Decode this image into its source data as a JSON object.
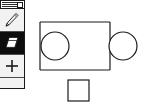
{
  "app": {
    "title": "",
    "background_color": "#ffffff",
    "ink_color": "#1a1a1a",
    "width": 155,
    "height": 110
  },
  "tool_palette": {
    "name": "Tools",
    "x": 0,
    "y": 0,
    "width": 25,
    "height": 89,
    "background_color": "#f2f2f2",
    "border_color": "#1a1a1a",
    "titlebar": {
      "stripe_color": "#2b2b2b",
      "close_box_label": "",
      "close_box_name": "close-box"
    },
    "tools": [
      {
        "id": "pencil",
        "label": "Pencil",
        "icon": "pencil-icon",
        "selected": false,
        "background_color": "#f2f2f2",
        "glyph_color": "#1a1a1a"
      },
      {
        "id": "eraser",
        "label": "Eraser",
        "icon": "eraser-icon",
        "selected": true,
        "background_color": "#0d0d0d",
        "glyph_color": "#ffffff"
      },
      {
        "id": "plus",
        "label": "Crosshair",
        "icon": "plus-icon",
        "selected": false,
        "background_color": "#f2f2f2",
        "glyph_color": "#1a1a1a"
      }
    ]
  },
  "canvas": {
    "name": "Drawing canvas",
    "x": 25,
    "y": 0,
    "width": 130,
    "height": 110,
    "background_color": "#ffffff",
    "stroke_color": "#1a1a1a",
    "stroke_width": 1.2,
    "shapes": [
      {
        "id": "puzzle-piece",
        "type": "compound-outline",
        "label": "Puzzle piece outline",
        "rect": {
          "x": 15,
          "y": 22,
          "width": 70,
          "height": 48
        },
        "left_notch_circle": {
          "cx": 30,
          "cy": 46,
          "r": 14
        },
        "right_tab_circle": {
          "cx": 98,
          "cy": 46,
          "r": 14
        }
      },
      {
        "id": "small-square",
        "type": "rect-outline",
        "label": "Small square",
        "rect": {
          "x": 43,
          "y": 80,
          "width": 21,
          "height": 21
        }
      }
    ]
  }
}
